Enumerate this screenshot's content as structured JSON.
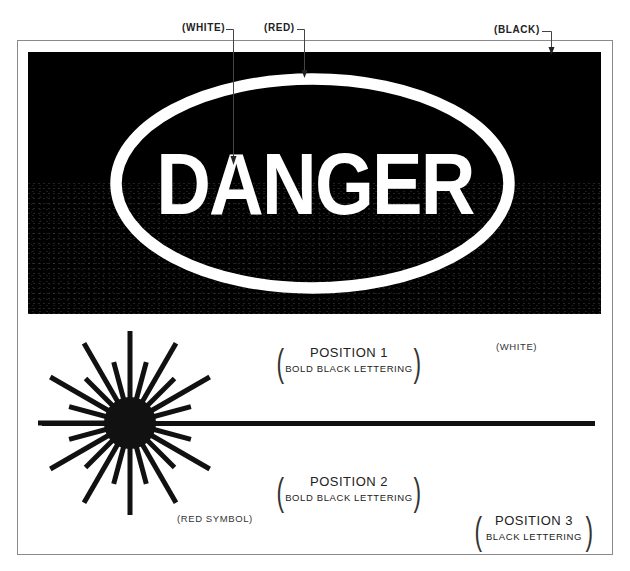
{
  "callouts": {
    "white": "(WHITE)",
    "red": "(RED)",
    "black": "(BLACK)"
  },
  "sign": {
    "header_word": "DANGER",
    "header_background_color": "#000000",
    "oval_color": "#ffffff",
    "text_color": "#ffffff"
  },
  "lower_panel": {
    "background_label": "(WHITE)",
    "symbol_label": "(RED SYMBOL)",
    "position_1": {
      "title": "POSITION 1",
      "subtitle": "BOLD BLACK LETTERING"
    },
    "position_2": {
      "title": "POSITION 2",
      "subtitle": "BOLD BLACK LETTERING"
    },
    "position_3": {
      "title": "POSITION 3",
      "subtitle": "BLACK LETTERING"
    }
  },
  "symbol": {
    "name": "laser-starburst-icon",
    "center": [
      130,
      423
    ],
    "core_radius": 26,
    "long_ray_length": 92,
    "short_ray_length": 63,
    "ray_count": 24
  }
}
